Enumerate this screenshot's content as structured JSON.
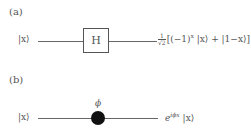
{
  "panel_a": {
    "label": "(a)",
    "input": "|x⟩",
    "gate": "H",
    "output_prefactor_num": "1",
    "output_prefactor_den": "√2",
    "output_expr_1": "[(−1)",
    "output_exp": "x",
    "output_expr_2": " |x⟩ + |1−x⟩]"
  },
  "panel_b": {
    "label": "(b)",
    "input": "|x⟩",
    "phase_label": "ϕ",
    "output_base": "e",
    "output_exp": "iϕx",
    "output_ket": " |x⟩"
  }
}
